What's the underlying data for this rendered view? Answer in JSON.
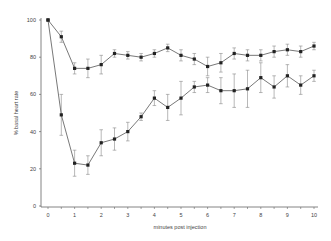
{
  "chart_data": {
    "type": "line",
    "title": "",
    "xlabel": "minutes post injection",
    "ylabel": "% basal heart rate",
    "xlim": [
      0,
      10
    ],
    "ylim": [
      0,
      100
    ],
    "x_ticks": [
      0,
      1,
      2,
      3,
      4,
      5,
      6,
      7,
      8,
      9,
      10
    ],
    "y_ticks": [
      0,
      20,
      40,
      60,
      80,
      100
    ],
    "grid": false,
    "legend": null,
    "x": [
      0,
      0.5,
      1,
      1.5,
      2,
      2.5,
      3,
      3.5,
      4,
      4.5,
      5,
      5.5,
      6,
      6.5,
      7,
      7.5,
      8,
      8.5,
      9,
      9.5,
      10
    ],
    "series": [
      {
        "name": "upper",
        "values": [
          100,
          91,
          74,
          74,
          76,
          82,
          81,
          80,
          82,
          85,
          81,
          79,
          75,
          77,
          82,
          81,
          81,
          83,
          84,
          83,
          86
        ],
        "error": [
          0,
          3,
          3,
          5,
          5,
          2,
          2,
          2,
          2,
          2,
          3,
          3,
          5,
          5,
          3,
          3,
          3,
          3,
          3,
          3,
          2
        ]
      },
      {
        "name": "lower",
        "values": [
          100,
          49,
          23,
          22,
          34,
          36,
          40,
          48,
          58,
          53,
          58,
          64,
          65,
          62,
          62,
          63,
          69,
          64,
          70,
          65,
          70
        ],
        "error": [
          0,
          11,
          7,
          5,
          7,
          6,
          5,
          2,
          4,
          7,
          9,
          3,
          4,
          7,
          9,
          10,
          8,
          6,
          6,
          5,
          3
        ]
      }
    ]
  },
  "axes": {
    "xlabel": "minutes post injection",
    "ylabel": "% basal heart rate",
    "x_tick_labels": [
      "0",
      "1",
      "2",
      "3",
      "4",
      "5",
      "6",
      "7",
      "8",
      "9",
      "10"
    ],
    "y_tick_labels": [
      "0",
      "20",
      "40",
      "60",
      "80",
      "100"
    ]
  }
}
